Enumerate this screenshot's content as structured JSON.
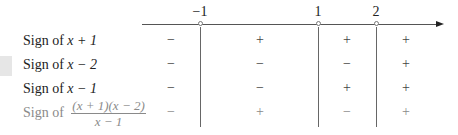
{
  "axis": {
    "points": [
      {
        "label": "−1",
        "x": 200
      },
      {
        "label": "1",
        "x": 318
      },
      {
        "label": "2",
        "x": 376
      }
    ]
  },
  "rows": [
    {
      "label_prefix": "Sign of ",
      "expr": "x + 1",
      "signs": [
        "−",
        "+",
        "+",
        "+"
      ]
    },
    {
      "label_prefix": "Sign of ",
      "expr": "x − 2",
      "signs": [
        "−",
        "−",
        "−",
        "+"
      ]
    },
    {
      "label_prefix": "Sign of ",
      "expr": "x − 1",
      "signs": [
        "−",
        "−",
        "+",
        "+"
      ]
    },
    {
      "label_prefix": "Sign of ",
      "numerator": "(x + 1)(x − 2)",
      "denominator": "x − 1",
      "signs": [
        "−",
        "+",
        "−",
        "+"
      ]
    }
  ],
  "colors": {
    "text": "#222222",
    "faded_text": "#8a8a8a",
    "axis": "#555555"
  }
}
